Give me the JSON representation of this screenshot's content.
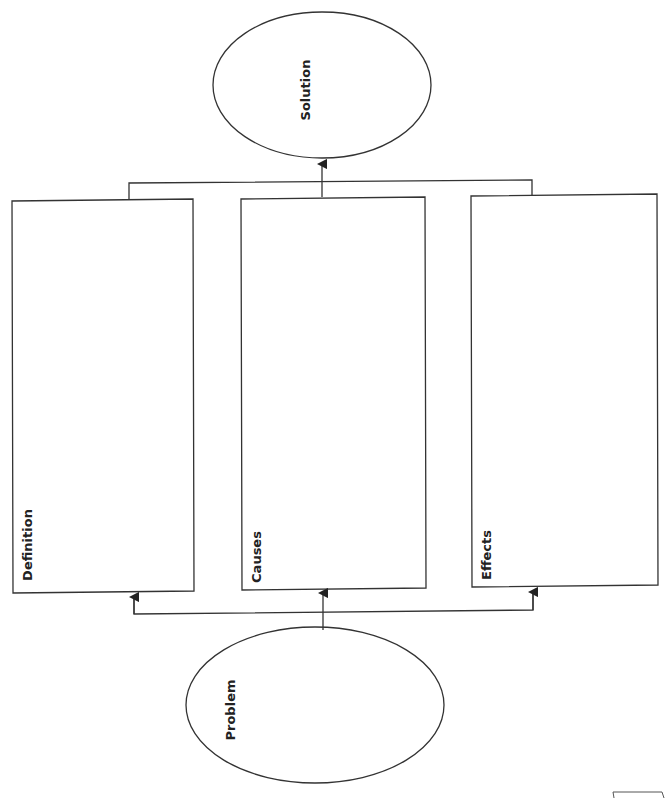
{
  "diagram": {
    "type": "problem-solution organizer",
    "nodes": {
      "solution": {
        "label": "Solution"
      },
      "problem": {
        "label": "Problem"
      },
      "boxes": [
        {
          "label": "Definition"
        },
        {
          "label": "Causes"
        },
        {
          "label": "Effects"
        }
      ]
    },
    "colors": {
      "stroke": "#333333",
      "background": "#ffffff"
    }
  }
}
